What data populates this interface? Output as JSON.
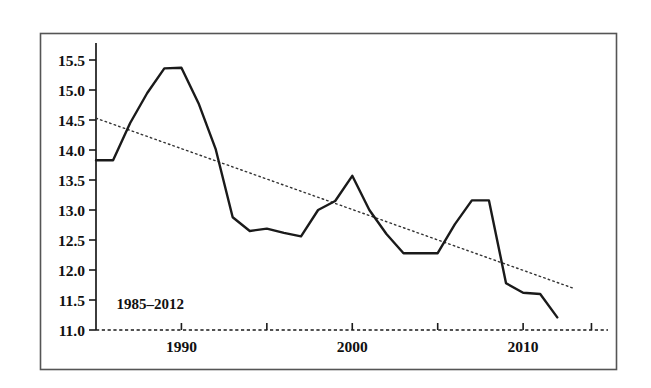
{
  "figure": {
    "background_color": "#ffffff",
    "frame_color": "#4a4a4a",
    "annotation": "1985–2012"
  },
  "chart_data": {
    "type": "line",
    "title": "",
    "subtitle": "",
    "xlabel": "",
    "ylabel": "",
    "xlim": [
      1985,
      2014.5
    ],
    "ylim": [
      11.0,
      15.75
    ],
    "grid": false,
    "legend": "none",
    "annotations": [
      {
        "text": "1985–2012",
        "x": 1986.2,
        "y": 11.35
      }
    ],
    "y_ticks": [
      11.0,
      11.5,
      12.0,
      12.5,
      13.0,
      13.5,
      14.0,
      14.5,
      15.0,
      15.5
    ],
    "y_tick_labels": [
      "11.0",
      "11.5",
      "12.0",
      "12.5",
      "13.0",
      "13.5",
      "14.0",
      "14.5",
      "15.0",
      "15.5"
    ],
    "x_ticks": [
      1990,
      1995,
      2000,
      2005,
      2010,
      2014
    ],
    "x_tick_labels": [
      "1990",
      "",
      "2000",
      "",
      "2010",
      ""
    ],
    "x_major_labeled": [
      "1990",
      "2000",
      "2010"
    ],
    "x": [
      1985,
      1986,
      1987,
      1988,
      1989,
      1990,
      1991,
      1992,
      1993,
      1994,
      1995,
      1996,
      1997,
      1998,
      1999,
      2000,
      2001,
      2002,
      2003,
      2004,
      2005,
      2006,
      2007,
      2008,
      2009,
      2010,
      2011,
      2012
    ],
    "series": [
      {
        "name": "series",
        "style": "solid",
        "color": "#1a1a1a",
        "width": 2.4,
        "values": [
          13.83,
          13.83,
          14.45,
          14.95,
          15.36,
          15.37,
          14.78,
          14.02,
          12.88,
          12.65,
          12.69,
          12.62,
          12.56,
          13.0,
          13.15,
          13.57,
          13.0,
          12.6,
          12.28,
          12.28,
          12.28,
          12.76,
          13.16,
          13.16,
          11.78,
          11.62,
          11.6,
          11.21
        ]
      },
      {
        "name": "trend",
        "style": "dotted",
        "color": "#333333",
        "width": 1.4,
        "x_endpoints": [
          1985,
          2013
        ],
        "y_endpoints": [
          14.53,
          11.69
        ]
      }
    ]
  }
}
